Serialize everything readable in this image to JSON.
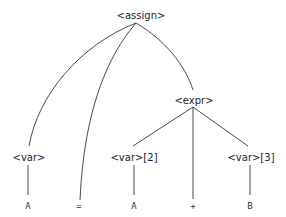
{
  "diagram": {
    "type": "parse-tree",
    "nodes": {
      "root": {
        "label": "<assign>",
        "kind": "nonterminal"
      },
      "var1": {
        "label": "<var>",
        "kind": "nonterminal"
      },
      "expr": {
        "label": "<expr>",
        "kind": "nonterminal"
      },
      "var2": {
        "label": "<var>[2]",
        "kind": "nonterminal"
      },
      "var3": {
        "label": "<var>[3]",
        "kind": "nonterminal"
      },
      "leaf_a1": {
        "label": "A",
        "kind": "terminal"
      },
      "leaf_eq": {
        "label": "=",
        "kind": "terminal"
      },
      "leaf_a2": {
        "label": "A",
        "kind": "terminal"
      },
      "leaf_plus": {
        "label": "+",
        "kind": "terminal"
      },
      "leaf_b": {
        "label": "B",
        "kind": "terminal"
      }
    },
    "edges": [
      [
        "<assign>",
        "<var>"
      ],
      [
        "<assign>",
        "="
      ],
      [
        "<assign>",
        "<expr>"
      ],
      [
        "<var>",
        "A"
      ],
      [
        "<expr>",
        "<var>[2]"
      ],
      [
        "<expr>",
        "+"
      ],
      [
        "<expr>",
        "<var>[3]"
      ],
      [
        "<var>[2]",
        "A"
      ],
      [
        "<var>[3]",
        "B"
      ]
    ]
  }
}
